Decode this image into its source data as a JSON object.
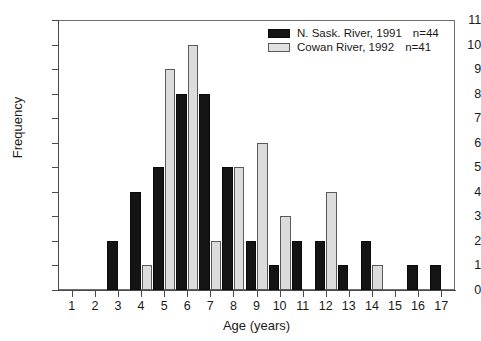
{
  "chart_data": {
    "type": "bar",
    "title": "",
    "xlabel": "Age (years)",
    "ylabel": "Frequency",
    "categories": [
      1,
      2,
      3,
      4,
      5,
      6,
      7,
      8,
      9,
      10,
      11,
      12,
      13,
      14,
      15,
      16,
      17
    ],
    "xtick_labels": [
      "1",
      "2",
      "3",
      "4",
      "5",
      "6",
      "7",
      "8",
      "9",
      "10",
      "11",
      "12",
      "13",
      "14",
      "15",
      "16",
      "17"
    ],
    "ytick_labels": [
      "0",
      "1",
      "2",
      "3",
      "4",
      "5",
      "6",
      "7",
      "8",
      "9",
      "10",
      "11"
    ],
    "ylim": [
      0,
      11
    ],
    "xlim": [
      0.4,
      17.6
    ],
    "grid": false,
    "legend_position": "top-right",
    "series": [
      {
        "name": "N. Sask. River, 1991",
        "n_label": "n=44",
        "n": 44,
        "color": "#141414",
        "style": "solid-black",
        "values": [
          0,
          0,
          2,
          4,
          5,
          8,
          8,
          5,
          2,
          1,
          2,
          2,
          1,
          2,
          0,
          1,
          1
        ]
      },
      {
        "name": "Cowan River, 1992",
        "n_label": "n=41",
        "n": 41,
        "color": "#dcdcdc",
        "style": "light-gray-outlined",
        "values": [
          0,
          0,
          0,
          1,
          9,
          10,
          2,
          5,
          6,
          3,
          0,
          4,
          0,
          1,
          0,
          0,
          0
        ]
      }
    ]
  },
  "figure": {
    "background": "#ffffff",
    "axis_color": "#4a4a4a"
  }
}
